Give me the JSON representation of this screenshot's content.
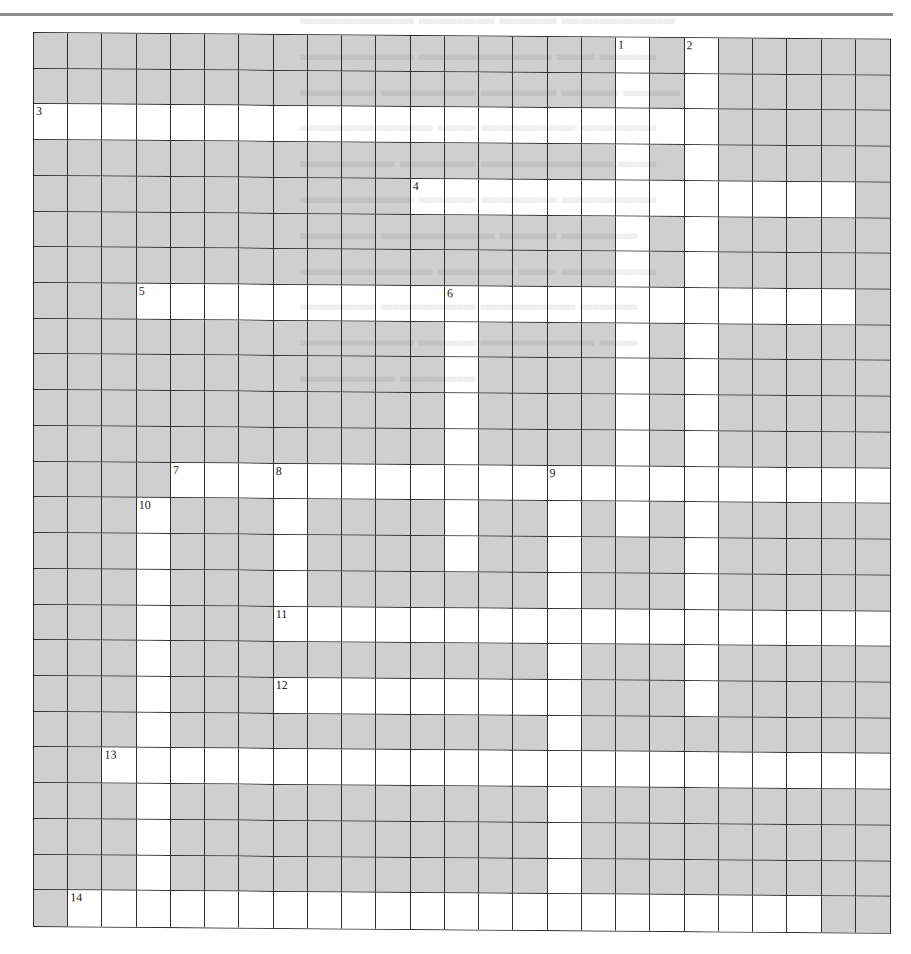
{
  "puzzle": {
    "rows": 25,
    "cols": 25,
    "block_color": "#cfcfcf",
    "open_color": "#ffffff",
    "line_color": "#2f2f2f",
    "layout": [
      "#################.#.#####",
      "#################.#.#####",
      "....................#####",
      "#################.#.#####",
      "###########.............#",
      "#################.#.#####",
      "#################.#.#####",
      "###.....................#",
      "############.####.#.#####",
      "############.####.#.#####",
      "############.####.#.#####",
      "############.####.#.#####",
      "####.....................",
      "###.###.####.##.#.#.#####",
      "###.###.####.##.###.#####",
      "###.###.#######.###.#####",
      "###.###..................",
      "###.###########.###.#####",
      "###.###.........###.#####",
      "###.###########.#########",
      "##.......................",
      "###.###########.#########",
      "###.###########.#########",
      "###.###########.#########",
      "#......................##"
    ],
    "numbers": [
      {
        "n": "1",
        "row": 0,
        "col": 17
      },
      {
        "n": "2",
        "row": 0,
        "col": 19
      },
      {
        "n": "3",
        "row": 2,
        "col": 0
      },
      {
        "n": "4",
        "row": 4,
        "col": 11
      },
      {
        "n": "5",
        "row": 7,
        "col": 3
      },
      {
        "n": "6",
        "row": 7,
        "col": 12
      },
      {
        "n": "7",
        "row": 12,
        "col": 4
      },
      {
        "n": "8",
        "row": 12,
        "col": 7
      },
      {
        "n": "9",
        "row": 12,
        "col": 15
      },
      {
        "n": "10",
        "row": 13,
        "col": 3
      },
      {
        "n": "11",
        "row": 16,
        "col": 7
      },
      {
        "n": "12",
        "row": 18,
        "col": 7
      },
      {
        "n": "13",
        "row": 20,
        "col": 2
      },
      {
        "n": "14",
        "row": 24,
        "col": 1
      }
    ]
  }
}
